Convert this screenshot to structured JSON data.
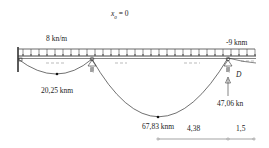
{
  "diagram": {
    "title_var": "x",
    "title_sub": "0",
    "title_rest": "= 0",
    "distributed_load": "8 kn/m",
    "end_moment": "-9 knm",
    "support_label": "D",
    "reaction": "47,06 kn",
    "span1_moment": "20,25 knm",
    "span2_moment": "67,83 knm",
    "dimensions": [
      "4,38",
      "1,5"
    ],
    "colors": {
      "line": "#333333",
      "hatch": "#777777"
    }
  }
}
